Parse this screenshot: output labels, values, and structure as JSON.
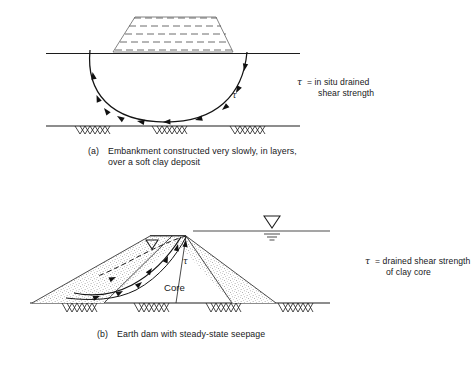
{
  "figure": {
    "title_hidden": "",
    "background_color": "#ffffff",
    "line_color": "#1c1c1c"
  },
  "panel_a": {
    "id": "a",
    "caption_marker": "(a)",
    "caption_line1": "Embankment constructed very slowly, in layers,",
    "caption_line2": "over a soft clay deposit",
    "tau_symbol": "τ",
    "note_line1": "= in situ drained",
    "note_line2": "shear strength",
    "slip_surface_label": "τ",
    "embankment_label": "embankment-trapezoid",
    "layers_count": 5,
    "ground_line_label": "original-ground-surface",
    "firm_base_label": "firm-stratum-base",
    "hatch_clusters": 3,
    "shear_arrows": 9
  },
  "panel_b": {
    "id": "b",
    "caption_marker": "(b)",
    "caption_line1": "Earth dam with steady-state seepage",
    "tau_symbol": "τ",
    "note_line1": "= drained shear strength",
    "note_line2": "of clay core",
    "core_label": "Core",
    "slip_surface_label": "τ",
    "water_table_symbol": "water-table-triangle",
    "reservoir_level_label": "reservoir-water-surface",
    "phreatic_label": "phreatic-surface-dashed",
    "hatch_clusters": 4,
    "shear_arrows": 6,
    "shell_texture": "stippled-sand-shell"
  }
}
